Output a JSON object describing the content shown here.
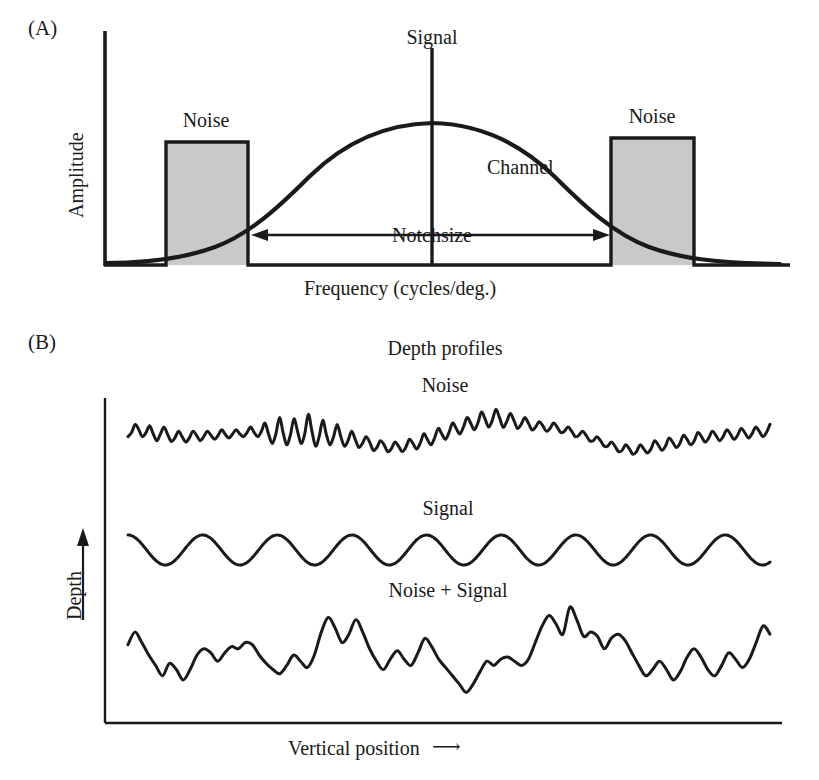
{
  "figure": {
    "background_color": "#ffffff",
    "ink_color": "#1a1a1a",
    "noise_band_fill": "#c9c9c9"
  },
  "panel_a": {
    "tag": "(A)",
    "y_axis_label": "Amplitude",
    "x_axis_label": "Frequency (cycles/deg.)",
    "signal_label": "Signal",
    "channel_label": "Channel",
    "notch_label": "Notchsize",
    "noise_label_left": "Noise",
    "noise_label_right": "Noise"
  },
  "panel_b": {
    "tag": "(B)",
    "title": "Depth profiles",
    "y_axis_label": "Depth",
    "y_axis_arrow": "⟶",
    "x_axis_label": "Vertical position",
    "x_axis_arrow": "⟶",
    "traces": [
      {
        "label": "Noise"
      },
      {
        "label": "Signal"
      },
      {
        "label": "Noise + Signal"
      }
    ]
  },
  "chart_data": [
    {
      "type": "area",
      "title": "Noise masking of a spatial-frequency channel",
      "panel": "(A)",
      "xlabel": "Frequency (cycles/deg.)",
      "ylabel": "Amplitude",
      "grid": false,
      "legend": "none",
      "axis_ranges": {
        "x": [
          0,
          1
        ],
        "y": [
          0,
          1
        ]
      },
      "annotations": [
        {
          "text": "Signal",
          "kind": "vertical-line-label",
          "x": 0.5
        },
        {
          "text": "Channel",
          "kind": "curve-label",
          "x": 0.58,
          "y": 0.44
        },
        {
          "text": "Notchsize",
          "kind": "double-arrow-label",
          "x_from": 0.215,
          "x_to": 0.74,
          "y": 0.13
        },
        {
          "text": "Noise",
          "kind": "bar-label",
          "x": 0.12
        },
        {
          "text": "Noise",
          "kind": "bar-label",
          "x": 0.845
        }
      ],
      "series": [
        {
          "name": "Channel sensitivity (Gaussian)",
          "type": "line",
          "peak_x": 0.5,
          "peak_y": 0.61,
          "sigma_x": 0.16,
          "comment": "smooth bell curve peaking at signal frequency"
        },
        {
          "name": "Noise bands",
          "type": "bar",
          "fill": "#c9c9c9",
          "bars": [
            {
              "x_from": 0.092,
              "x_to": 0.213,
              "height": 0.53
            },
            {
              "x_from": 0.75,
              "x_to": 0.873,
              "height": 0.55
            }
          ]
        },
        {
          "name": "Signal line",
          "type": "vline",
          "x": 0.5,
          "y_from": 0.0,
          "y_to": 0.93
        }
      ]
    },
    {
      "type": "line",
      "title": "Depth profiles",
      "panel": "(B)",
      "xlabel": "Vertical position",
      "ylabel": "Depth",
      "grid": false,
      "legend": "none",
      "series": [
        {
          "name": "Noise",
          "kind": "bandpass-noise",
          "y_values": [
            0.52,
            0.58,
            0.7,
            0.62,
            0.52,
            0.58,
            0.68,
            0.56,
            0.46,
            0.56,
            0.66,
            0.55,
            0.45,
            0.5,
            0.6,
            0.52,
            0.44,
            0.5,
            0.6,
            0.54,
            0.46,
            0.52,
            0.6,
            0.54,
            0.48,
            0.54,
            0.62,
            0.55,
            0.5,
            0.56,
            0.62,
            0.56,
            0.52,
            0.58,
            0.66,
            0.58,
            0.52,
            0.6,
            0.72,
            0.55,
            0.42,
            0.56,
            0.8,
            0.58,
            0.4,
            0.54,
            0.78,
            0.6,
            0.42,
            0.56,
            0.85,
            0.6,
            0.38,
            0.52,
            0.76,
            0.55,
            0.4,
            0.52,
            0.7,
            0.52,
            0.38,
            0.46,
            0.6,
            0.48,
            0.36,
            0.42,
            0.52,
            0.44,
            0.32,
            0.36,
            0.46,
            0.4,
            0.3,
            0.34,
            0.44,
            0.38,
            0.3,
            0.36,
            0.48,
            0.42,
            0.34,
            0.42,
            0.56,
            0.48,
            0.4,
            0.5,
            0.64,
            0.56,
            0.48,
            0.58,
            0.72,
            0.64,
            0.56,
            0.66,
            0.8,
            0.72,
            0.62,
            0.72,
            0.88,
            0.78,
            0.66,
            0.76,
            0.92,
            0.8,
            0.66,
            0.74,
            0.86,
            0.76,
            0.64,
            0.7,
            0.8,
            0.72,
            0.62,
            0.66,
            0.74,
            0.68,
            0.6,
            0.64,
            0.72,
            0.66,
            0.58,
            0.6,
            0.66,
            0.6,
            0.52,
            0.54,
            0.6,
            0.54,
            0.46,
            0.46,
            0.52,
            0.46,
            0.38,
            0.38,
            0.44,
            0.38,
            0.3,
            0.32,
            0.4,
            0.34,
            0.26,
            0.3,
            0.4,
            0.34,
            0.28,
            0.34,
            0.46,
            0.4,
            0.32,
            0.38,
            0.5,
            0.44,
            0.36,
            0.42,
            0.54,
            0.48,
            0.4,
            0.46,
            0.58,
            0.52,
            0.44,
            0.5,
            0.6,
            0.54,
            0.46,
            0.52,
            0.62,
            0.56,
            0.48,
            0.54,
            0.64,
            0.58,
            0.5,
            0.56,
            0.66,
            0.6,
            0.52,
            0.58,
            0.7
          ]
        },
        {
          "name": "Signal",
          "kind": "sinusoid",
          "cycles": 8.6,
          "amplitude": 0.5,
          "mean": 0.5
        },
        {
          "name": "Noise + Signal",
          "kind": "sum-of-noise-and-sinusoid",
          "y_values": [
            0.6,
            0.72,
            0.62,
            0.5,
            0.4,
            0.3,
            0.42,
            0.36,
            0.26,
            0.36,
            0.5,
            0.56,
            0.52,
            0.44,
            0.52,
            0.58,
            0.56,
            0.62,
            0.6,
            0.5,
            0.42,
            0.36,
            0.32,
            0.4,
            0.5,
            0.44,
            0.38,
            0.5,
            0.72,
            0.86,
            0.76,
            0.62,
            0.7,
            0.84,
            0.72,
            0.56,
            0.44,
            0.36,
            0.46,
            0.54,
            0.46,
            0.4,
            0.52,
            0.66,
            0.58,
            0.46,
            0.38,
            0.3,
            0.22,
            0.14,
            0.22,
            0.34,
            0.44,
            0.4,
            0.46,
            0.48,
            0.44,
            0.4,
            0.46,
            0.62,
            0.78,
            0.88,
            0.8,
            0.7,
            0.96,
            0.84,
            0.68,
            0.72,
            0.68,
            0.56,
            0.66,
            0.7,
            0.64,
            0.52,
            0.4,
            0.3,
            0.36,
            0.44,
            0.36,
            0.26,
            0.34,
            0.48,
            0.56,
            0.48,
            0.36,
            0.3,
            0.4,
            0.52,
            0.46,
            0.38,
            0.46,
            0.62,
            0.78,
            0.7
          ]
        }
      ]
    }
  ]
}
